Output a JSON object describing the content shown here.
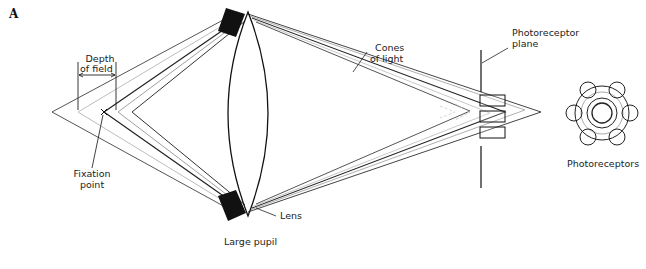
{
  "figure": {
    "panel_label": "A",
    "labels": {
      "depth_of_field_line1": "Depth",
      "depth_of_field_line2": "of field",
      "fixation_line1": "Fixation",
      "fixation_line2": "point",
      "cones_line1": "Cones",
      "cones_line2": "of light",
      "plane_line1": "Photoreceptor",
      "plane_line2": "plane",
      "photoreceptors": "Photoreceptors",
      "lens": "Lens",
      "pupil": "Large pupil"
    },
    "colors": {
      "ink": "#1a1a1a",
      "gray_ray": "#9a9a9a",
      "light_ray": "#c4c4c4",
      "pupil_fill": "#111111"
    }
  }
}
